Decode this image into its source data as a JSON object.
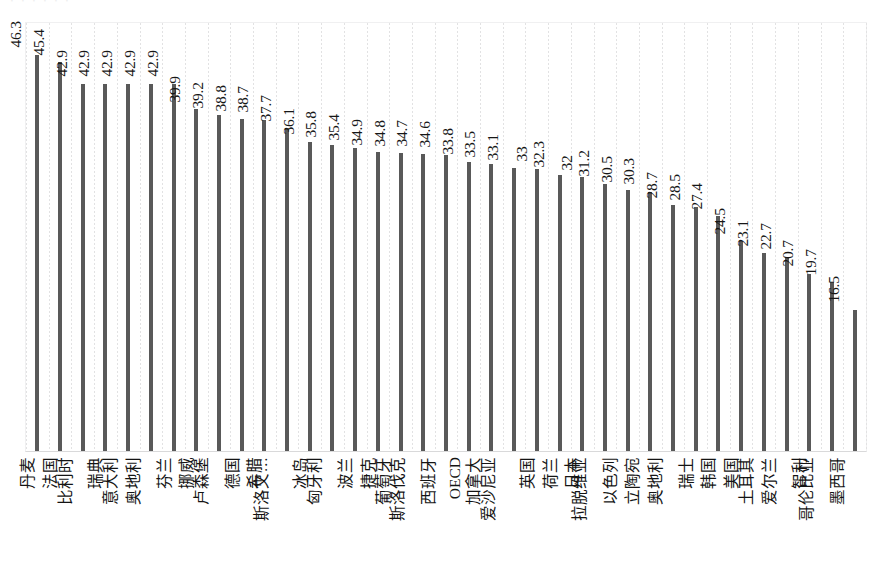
{
  "page": {
    "title_remnant": "‧  ‧  ‧   ‧      ‧ ‧",
    "background_color": "#ffffff"
  },
  "chart_style": {
    "bar_color": "#595959",
    "gridline_color": "#e2e2e3",
    "axis_color": "#d9d9da",
    "text_color": "#161616"
  },
  "chart_data": {
    "type": "bar",
    "title": "",
    "subtitle": "",
    "xlabel": "",
    "ylabel": "",
    "ylim": [
      0,
      50
    ],
    "grid": "vertical-dotted",
    "legend": "none",
    "orientation": "vertical",
    "value_labels": true,
    "label_rotation_deg": -90,
    "categories": [
      "丹麦",
      "法国",
      "比利时",
      "瑞典",
      "意大利",
      "奥地利",
      "芬兰",
      "挪威",
      "卢森堡",
      "德国",
      "希腊",
      "斯洛文…",
      "冰岛",
      "匈牙利",
      "波兰",
      "捷克",
      "葡萄牙",
      "斯洛伐克",
      "西班牙",
      "OECD",
      "加拿大",
      "爱沙尼亚",
      "英国",
      "荷兰",
      "日本",
      "拉脱维亚",
      "以色列",
      "立陶宛",
      "奥地利",
      "瑞士",
      "韩国",
      "美国",
      "土耳其",
      "爱尔兰",
      "智利",
      "哥伦比亚",
      "墨西哥"
    ],
    "values": [
      46.3,
      45.4,
      42.9,
      42.9,
      42.9,
      42.9,
      42.9,
      39.9,
      39.2,
      38.8,
      38.7,
      37.7,
      36.1,
      35.8,
      35.4,
      34.9,
      34.8,
      34.7,
      34.6,
      33.8,
      33.5,
      33.1,
      33,
      32.3,
      32,
      31.2,
      30.5,
      30.3,
      28.7,
      28.5,
      27.4,
      24.5,
      23.1,
      22.7,
      20.7,
      19.7,
      16.5
    ],
    "value_label_texts": [
      "46.3",
      "45.4",
      "42.9",
      "42.9",
      "42.9",
      "42.9",
      "42.9",
      "39.9",
      "39.2",
      "38.8",
      "38.7",
      "37.7",
      "36.1",
      "35.8",
      "35.4",
      "34.9",
      "34.8",
      "34.7",
      "34.6",
      "33.8",
      "33.5",
      "33.1",
      "33",
      "32.3",
      "32",
      "31.2",
      "30.5",
      "30.3",
      "28.7",
      "28.5",
      "27.4",
      "24.5",
      "23.1",
      "22.7",
      "20.7",
      "19.7",
      "16.5"
    ]
  }
}
